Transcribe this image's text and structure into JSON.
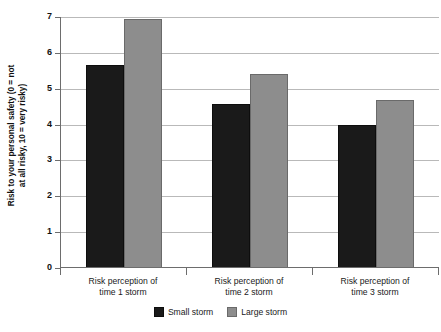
{
  "chart_data": {
    "type": "bar",
    "title": "",
    "xlabel": "",
    "ylabel_line1": "Risk to your personal safety (0 = not",
    "ylabel_line2": "at all risky, 10 = very risky)",
    "categories": [
      "Risk perception of time 1 storm",
      "Risk perception of time 2 storm",
      "Risk perception of time 3 storm"
    ],
    "category_lines": [
      [
        "Risk perception of",
        "time 1 storm"
      ],
      [
        "Risk perception of",
        "time 2 storm"
      ],
      [
        "Risk perception of",
        "time 3 storm"
      ]
    ],
    "series": [
      {
        "name": "Small storm",
        "color": "#1a1a1a",
        "values": [
          5.65,
          4.58,
          4.0
        ]
      },
      {
        "name": "Large storm",
        "color": "#8d8d8d",
        "values": [
          6.95,
          5.42,
          4.68
        ]
      }
    ],
    "ylim": [
      0,
      7
    ],
    "yticks": [
      0,
      1,
      2,
      3,
      4,
      5,
      6,
      7
    ],
    "ytick_labels": [
      "0",
      "1",
      "2",
      "3",
      "4",
      "5",
      "6",
      "7"
    ],
    "grid": true,
    "legend_position": "bottom-center"
  }
}
